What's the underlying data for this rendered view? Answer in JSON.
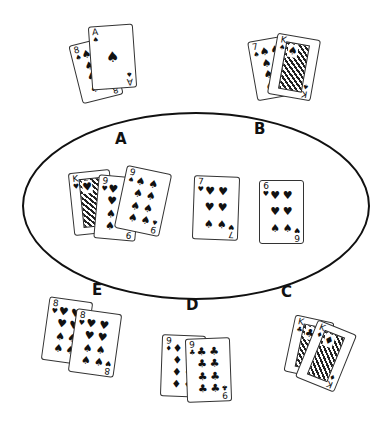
{
  "diagram": {
    "type": "card-table-seating",
    "table_shape": "oval",
    "seats": [
      {
        "label": "A",
        "hand": [
          {
            "rank": "8",
            "suit": "♠"
          },
          {
            "rank": "A",
            "suit": "♠"
          }
        ]
      },
      {
        "label": "B",
        "hand": [
          {
            "rank": "7",
            "suit": "♠"
          },
          {
            "rank": "K",
            "suit": "♠"
          }
        ]
      },
      {
        "label": "C",
        "hand": [
          {
            "rank": "K",
            "suit": "♣"
          },
          {
            "rank": "K",
            "suit": "♦"
          }
        ]
      },
      {
        "label": "D",
        "hand": [
          {
            "rank": "9",
            "suit": "♦"
          },
          {
            "rank": "9",
            "suit": "♣"
          }
        ]
      },
      {
        "label": "E",
        "hand": [
          {
            "rank": "8",
            "suit": "♥"
          },
          {
            "rank": "8",
            "suit": "♥"
          }
        ]
      }
    ],
    "center_cards": [
      {
        "rank": "K",
        "suit": "♥"
      },
      {
        "rank": "9",
        "suit": "♥"
      },
      {
        "rank": "9",
        "suit": "♠"
      },
      {
        "rank": "7",
        "suit": "♥"
      },
      {
        "rank": "6",
        "suit": "♥"
      }
    ]
  }
}
